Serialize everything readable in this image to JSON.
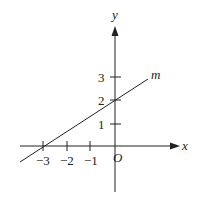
{
  "diagram": {
    "type": "coordinate-plane",
    "axes": {
      "x_label": "x",
      "y_label": "y",
      "origin_label": "O"
    },
    "x_ticks": [
      {
        "value": -3,
        "label": "−3"
      },
      {
        "value": -2,
        "label": "−2"
      },
      {
        "value": -1,
        "label": "−1"
      }
    ],
    "y_ticks": [
      {
        "value": 1,
        "label": "1"
      },
      {
        "value": 2,
        "label": "2"
      },
      {
        "value": 3,
        "label": "3"
      }
    ],
    "line": {
      "name": "m",
      "x_intercept": -3,
      "y_intercept": 2,
      "slope": "2/3"
    }
  }
}
